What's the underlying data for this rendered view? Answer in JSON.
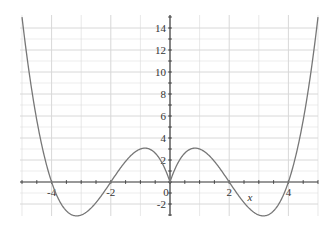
{
  "chart_data": {
    "type": "line",
    "title": "",
    "xlabel": "x",
    "ylabel": "",
    "function": "|x|(|x|-2)(|x|-4)",
    "xlim": [
      -5,
      5
    ],
    "ylim": [
      -3,
      15
    ],
    "grid": true,
    "x_ticks": [
      "-4",
      "-2",
      "0",
      "2",
      "4"
    ],
    "y_ticks": [
      "-2",
      "2",
      "4",
      "6",
      "8",
      "10",
      "12",
      "14"
    ],
    "series": [
      {
        "name": "f(x)",
        "x": [
          -5,
          -4,
          -3,
          -2,
          -1,
          0,
          1,
          2,
          3,
          4,
          5
        ],
        "values": [
          15,
          0,
          -3,
          0,
          3,
          0,
          3,
          0,
          -3,
          0,
          15
        ]
      }
    ],
    "colors": {
      "curve": "#777777",
      "axis": "#333333",
      "grid": "#d8d8d8"
    }
  }
}
